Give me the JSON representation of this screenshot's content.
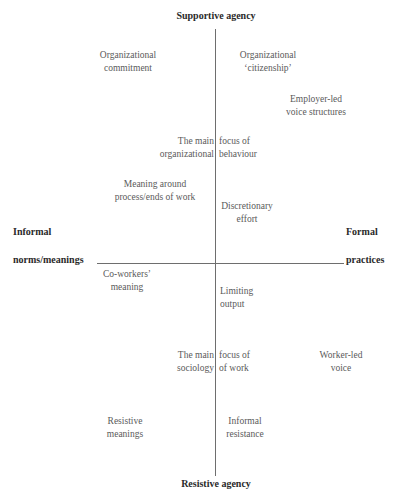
{
  "axes": {
    "top": "Supportive agency",
    "bottom": "Resistive agency",
    "left": [
      "Informal",
      "norms/meanings"
    ],
    "right": [
      "Formal",
      "practices"
    ]
  },
  "items": {
    "org_commitment": [
      "Organizational",
      "commitment"
    ],
    "org_citizenship": [
      "Organizational",
      "‘citizenship’"
    ],
    "employer_voice": [
      "Employer-led",
      "voice structures"
    ],
    "ob_focus_left": [
      "The main",
      "organizational"
    ],
    "ob_focus_right": [
      "focus of",
      "behaviour"
    ],
    "meaning_process": [
      "Meaning around",
      "process/ends of work"
    ],
    "discretionary": [
      "Discretionary",
      "effort"
    ],
    "coworkers": [
      "Co-workers’",
      "meaning"
    ],
    "limiting": [
      "Limiting",
      "output"
    ],
    "sow_focus_left": [
      "The main",
      "sociology"
    ],
    "sow_focus_right": [
      "focus of",
      "of work"
    ],
    "worker_voice": [
      "Worker-led",
      "voice"
    ],
    "resistive_meanings": [
      "Resistive",
      "meanings"
    ],
    "informal_resistance": [
      "Informal",
      "resistance"
    ]
  },
  "colors": {
    "line": "#6e6e6e",
    "text": "#5a5a5a",
    "axis_text": "#2a2a2a"
  }
}
